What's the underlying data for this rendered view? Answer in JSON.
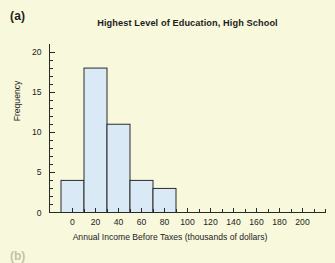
{
  "figure": {
    "panel_label": "(a)",
    "next_panel_label": "(b)",
    "background_color": "#f7f8dc",
    "bar_fill_color": "#d9eaf6",
    "bar_edge_color": "#2a2a2a"
  },
  "chart_data": {
    "type": "bar",
    "title": "Highest Level of Education, High School",
    "xlabel": "Annual Income Before Taxes (thousands of dollars)",
    "ylabel": "Frequency",
    "grid": false,
    "legend": "none",
    "xlim": [
      -20,
      220
    ],
    "ylim": [
      0,
      21
    ],
    "xticks": [
      0,
      20,
      40,
      60,
      80,
      100,
      120,
      140,
      160,
      180,
      200
    ],
    "xtick_labels": [
      "0",
      "20",
      "40",
      "60",
      "80",
      "100",
      "120",
      "140",
      "160",
      "180",
      "200"
    ],
    "x_minor_tick_step": 10,
    "yticks": [
      0,
      5,
      10,
      15,
      20
    ],
    "ytick_labels": [
      "0",
      "5",
      "10",
      "15",
      "20"
    ],
    "y_minor_tick_step": 1,
    "bin_width": 20,
    "bin_edges": [
      -10,
      10,
      30,
      50,
      70,
      90
    ],
    "categories": [
      "-10 to 10",
      "10 to 30",
      "30 to 50",
      "50 to 70",
      "70 to 90"
    ],
    "values": [
      4,
      18,
      11,
      4,
      3
    ],
    "bars": [
      {
        "label": "-10 to 10",
        "x0": -10,
        "x1": 10,
        "value": 4
      },
      {
        "label": "10 to 30",
        "x0": 10,
        "x1": 30,
        "value": 18
      },
      {
        "label": "30 to 50",
        "x0": 30,
        "x1": 50,
        "value": 11
      },
      {
        "label": "50 to 70",
        "x0": 50,
        "x1": 70,
        "value": 4
      },
      {
        "label": "70 to 90",
        "x0": 70,
        "x1": 90,
        "value": 3
      }
    ]
  }
}
